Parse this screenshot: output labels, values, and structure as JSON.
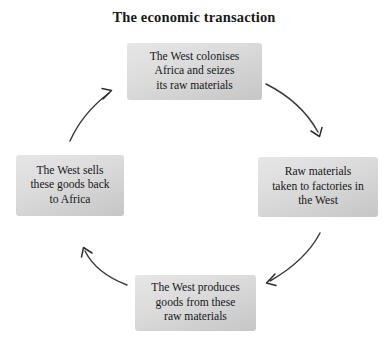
{
  "title": "The economic transaction",
  "background_color": "#ffffff",
  "box_fill_color": "#dcdcdc",
  "text_color": "#17171a",
  "arrow_color": "#3a3a3e",
  "nodes": [
    {
      "id": "top",
      "position": "top",
      "text": "The West colonises\nAfrica and seizes\nits raw materials"
    },
    {
      "id": "right",
      "position": "right",
      "text": "Raw materials\ntaken to factories in\nthe West"
    },
    {
      "id": "bottom",
      "position": "bottom",
      "text": "The West produces\ngoods from these\nraw materials"
    },
    {
      "id": "left",
      "position": "left",
      "text": "The West sells\nthese goods back\nto Africa"
    }
  ],
  "arrows": [
    {
      "id": "top-right",
      "from": "top",
      "to": "right",
      "direction": "clockwise",
      "icon": "curved-arrow-icon"
    },
    {
      "id": "right-bottom",
      "from": "right",
      "to": "bottom",
      "direction": "clockwise",
      "icon": "curved-arrow-icon"
    },
    {
      "id": "bottom-left",
      "from": "bottom",
      "to": "left",
      "direction": "clockwise",
      "icon": "curved-arrow-icon"
    },
    {
      "id": "left-top",
      "from": "left",
      "to": "top",
      "direction": "clockwise",
      "icon": "curved-arrow-icon"
    }
  ]
}
